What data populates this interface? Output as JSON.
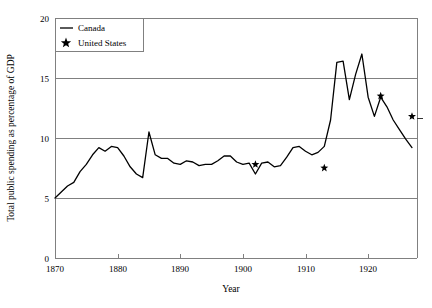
{
  "chart_data": {
    "type": "line",
    "title": "",
    "subtitle": "",
    "xlabel": "Year",
    "ylabel": "Total public spending as percentage of GDP",
    "xlim": [
      1870,
      1927.8
    ],
    "ylim": [
      0,
      20
    ],
    "grid": "horizontal",
    "xticks": [
      1870,
      1880,
      1890,
      1900,
      1910,
      1920
    ],
    "xtick_labels": [
      "1870",
      "1880",
      "1890",
      "1900",
      "1910",
      "1920"
    ],
    "yticks": [
      0,
      5,
      10,
      15,
      20
    ],
    "ytick_labels": [
      "0",
      "5",
      "10",
      "15",
      "20"
    ],
    "legend_position": "top-left",
    "series": [
      {
        "name": "Canada",
        "marker": "line",
        "x": [
          1870,
          1871,
          1872,
          1873,
          1874,
          1875,
          1876,
          1877,
          1878,
          1879,
          1880,
          1881,
          1882,
          1883,
          1884,
          1885,
          1886,
          1887,
          1888,
          1889,
          1890,
          1891,
          1892,
          1893,
          1894,
          1895,
          1896,
          1897,
          1898,
          1899,
          1900,
          1901,
          1902,
          1903,
          1904,
          1905,
          1906,
          1907,
          1908,
          1909,
          1910,
          1911,
          1912,
          1913,
          1914,
          1915,
          1916,
          1917,
          1918,
          1919,
          1920,
          1921,
          1922,
          1923,
          1924,
          1925,
          1926,
          1927
        ],
        "values": [
          5.0,
          5.5,
          6.0,
          6.3,
          7.2,
          7.8,
          8.6,
          9.2,
          8.9,
          9.3,
          9.2,
          8.5,
          7.6,
          7.0,
          6.7,
          10.5,
          8.6,
          8.3,
          8.3,
          7.9,
          7.8,
          8.1,
          8.0,
          7.7,
          7.8,
          7.8,
          8.1,
          8.5,
          8.5,
          8.0,
          7.8,
          7.9,
          7.0,
          7.9,
          8.0,
          7.6,
          7.7,
          8.4,
          9.2,
          9.3,
          8.9,
          8.6,
          8.8,
          9.3,
          11.5,
          16.3,
          16.4,
          13.2,
          15.3,
          17.0,
          13.4,
          11.8,
          13.4,
          12.6,
          11.5,
          10.7,
          9.9,
          9.2
        ]
      },
      {
        "name": "United States",
        "marker": "star",
        "x": [
          1902,
          1913,
          1922,
          1927
        ],
        "values": [
          7.8,
          7.5,
          13.5,
          11.8
        ]
      }
    ]
  },
  "legend": {
    "entries": [
      {
        "label": "Canada",
        "marker": "line"
      },
      {
        "label": "United States",
        "marker": "star"
      }
    ]
  },
  "colors": {
    "line": "#000000",
    "grid": "#808080",
    "axis": "#808080",
    "text": "#000000",
    "background": "#ffffff"
  }
}
